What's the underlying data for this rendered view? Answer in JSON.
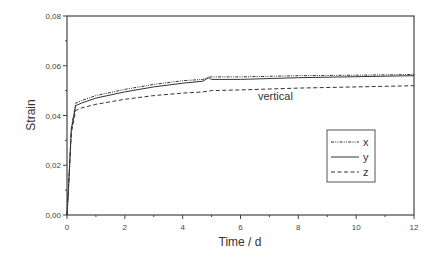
{
  "chart_data": {
    "type": "line",
    "title": "",
    "xlabel": "Time / d",
    "ylabel": "Strain",
    "xlim": [
      0,
      12
    ],
    "ylim": [
      0.0,
      0.08
    ],
    "xticks": [
      "0",
      "2",
      "4",
      "6",
      "8",
      "10",
      "12"
    ],
    "yticks": [
      "0,00",
      "0,02",
      "0,04",
      "0,06",
      "0,08"
    ],
    "grid": false,
    "legend_position": "lower right (inside)",
    "annotations": [
      {
        "text": "vertical",
        "x": 8.0,
        "y": 0.047
      }
    ],
    "x": [
      0,
      0.05,
      0.15,
      0.3,
      0.5,
      1,
      2,
      3,
      4,
      4.7,
      4.9,
      5.0,
      6,
      8,
      10,
      12
    ],
    "series": [
      {
        "name": "x",
        "style": "dash-dot-dot",
        "values": [
          0,
          0.01,
          0.035,
          0.045,
          0.046,
          0.048,
          0.0505,
          0.0525,
          0.054,
          0.0545,
          0.0555,
          0.0555,
          0.0555,
          0.056,
          0.0562,
          0.0565
        ]
      },
      {
        "name": "y",
        "style": "solid",
        "values": [
          0,
          0.01,
          0.034,
          0.044,
          0.045,
          0.047,
          0.0495,
          0.0515,
          0.053,
          0.0538,
          0.0552,
          0.0545,
          0.0545,
          0.0552,
          0.0556,
          0.056
        ]
      },
      {
        "name": "z",
        "style": "dashed",
        "values": [
          0,
          0.01,
          0.033,
          0.042,
          0.043,
          0.0445,
          0.0465,
          0.048,
          0.049,
          0.0495,
          0.0498,
          0.05,
          0.0503,
          0.051,
          0.0515,
          0.052
        ]
      }
    ]
  },
  "axes": {
    "xlabel": "Time / d",
    "ylabel": "Strain",
    "xticks": [
      "0",
      "2",
      "4",
      "6",
      "8",
      "10",
      "12"
    ],
    "yticks": [
      "0,00",
      "0,02",
      "0,04",
      "0,06",
      "0,08"
    ]
  },
  "annotation": "vertical",
  "legend": [
    {
      "label": "x",
      "style": "dash-dot-dot"
    },
    {
      "label": "y",
      "style": "solid"
    },
    {
      "label": "z",
      "style": "dashed"
    }
  ],
  "colors": {
    "line": "#333333",
    "frame": "#444444"
  }
}
